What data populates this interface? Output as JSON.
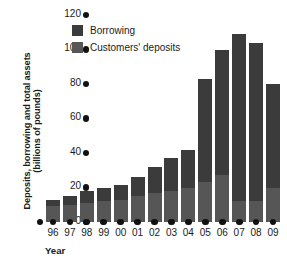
{
  "chart_data": {
    "type": "bar",
    "title": "",
    "subtitle": "",
    "xlabel": "Year",
    "ylabel": "Deposits, borrowing and total assets (billions of pounds)",
    "ylabel_line1": "Deposits, borrowing and total assets",
    "ylabel_line2": "(billions of pounds)",
    "stacked": true,
    "grid": false,
    "legend_position": "top-left-inside",
    "ylim": [
      0,
      120
    ],
    "yticks": [
      0,
      20,
      40,
      60,
      80,
      100,
      120
    ],
    "ytick_labels": [
      "0",
      "20",
      "40",
      "60",
      "80",
      "100",
      "120"
    ],
    "categories": [
      "96",
      "97",
      "98",
      "99",
      "00",
      "01",
      "02",
      "03",
      "04",
      "05",
      "06",
      "07",
      "08",
      "09"
    ],
    "series": [
      {
        "name": "Customers' deposits",
        "color": "#565656",
        "values": [
          9,
          10,
          11,
          12,
          13,
          15,
          17,
          18,
          20,
          23,
          27,
          12,
          12,
          20
        ]
      },
      {
        "name": "Borrowing",
        "color": "#3b3b3b",
        "values": [
          4,
          5,
          7,
          7.5,
          8.5,
          11,
          15,
          19,
          22,
          60,
          73,
          97,
          92,
          60
        ]
      }
    ],
    "totals": [
      13,
      15,
      18,
      19.5,
      21.5,
      26,
      32,
      37,
      42,
      83,
      100,
      109,
      104,
      80
    ]
  },
  "legend": {
    "items": [
      {
        "label": "Borrowing",
        "color": "#3b3b3b"
      },
      {
        "label": "Customers' deposits",
        "color": "#565656"
      }
    ]
  },
  "axes": {
    "x_title": "Year",
    "y_title_line1": "Deposits, borrowing and total assets",
    "y_title_line2": "(billions of pounds)"
  }
}
